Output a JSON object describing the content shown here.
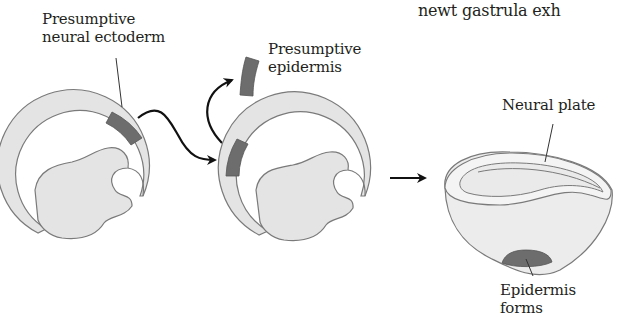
{
  "header_fragment": "newt gastrula exh",
  "labels": {
    "presumptive_neural_ectoderm": [
      "Presumptive",
      "neural ectoderm"
    ],
    "presumptive_epidermis": [
      "Presumptive",
      "epidermis"
    ],
    "neural_plate": "Neural plate",
    "epidermis_forms": [
      "Epidermis",
      "forms"
    ]
  },
  "colors": {
    "tissue_light": "#e4e4e4",
    "tissue_dark": "#6d6d6d",
    "outline": "#7a7a7a",
    "arrow": "#111111",
    "text": "#231f20"
  },
  "stages": [
    {
      "name": "donor-gastrula",
      "graft_region": "presumptive neural ectoderm"
    },
    {
      "name": "host-gastrula",
      "graft_region": "presumptive epidermis (replaced)"
    },
    {
      "name": "neurula",
      "result": "Epidermis forms"
    }
  ]
}
